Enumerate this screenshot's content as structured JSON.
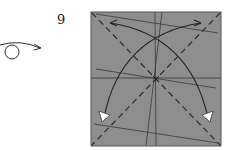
{
  "step": {
    "number": "9"
  },
  "symbols": {
    "turn_over": "turn-over-icon",
    "valley_folds": "dashed diagonals",
    "fold_arrows": "curved arrows to corners"
  },
  "colors": {
    "paper": "#8c8c8c",
    "line": "#333333",
    "arrowhead": "#ffffff"
  }
}
